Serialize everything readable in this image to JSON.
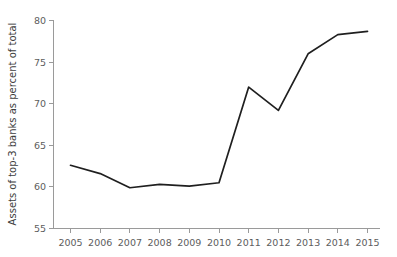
{
  "chart_data": {
    "type": "line",
    "title": "",
    "xlabel": "",
    "ylabel": "Assets of top-3 banks as percent of total",
    "x": [
      2005,
      2006,
      2007,
      2008,
      2009,
      2010,
      2011,
      2012,
      2013,
      2014,
      2015
    ],
    "values": [
      62.6,
      61.6,
      59.9,
      60.3,
      60.1,
      60.5,
      72.0,
      69.2,
      76.0,
      78.3,
      78.7
    ],
    "series": [
      {
        "name": "Assets of top-3 banks as percent of total",
        "values": [
          62.6,
          61.6,
          59.9,
          60.3,
          60.1,
          60.5,
          72.0,
          69.2,
          76.0,
          78.3,
          78.7
        ]
      }
    ],
    "xlim": [
      2005,
      2015
    ],
    "ylim": [
      55,
      80
    ],
    "x_tick_labels": [
      "2005",
      "2006",
      "2007",
      "2008",
      "2009",
      "2010",
      "2011",
      "2012",
      "2013",
      "2014",
      "2015"
    ],
    "y_tick_labels": [
      "55",
      "60",
      "65",
      "70",
      "75",
      "80"
    ],
    "y_ticks": [
      55,
      60,
      65,
      70,
      75,
      80
    ],
    "grid": false,
    "legend": false,
    "legend_position": "none",
    "line_color": "#1f1f1f",
    "background_color": "#ffffff",
    "axis_color": "#9a9a9a",
    "tick_label_color": "#5d5d5d"
  }
}
